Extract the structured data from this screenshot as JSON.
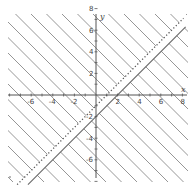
{
  "chart_data": {
    "type": "inequality-graph",
    "title": "",
    "xlabel": "x",
    "ylabel": "y",
    "xlim": [
      -8,
      8
    ],
    "ylim": [
      -8,
      8
    ],
    "x_ticks": [
      -6,
      -4,
      -2,
      2,
      4,
      6,
      8
    ],
    "y_ticks": [
      8,
      6,
      4,
      2,
      -2,
      -4,
      -6
    ],
    "grid": false,
    "boundary_lines": [
      {
        "name": "solid",
        "equation": "y = x - 2",
        "slope": 1,
        "intercept": -2,
        "style": "solid"
      },
      {
        "name": "dotted",
        "equation": "y = x - 1",
        "slope": 1,
        "intercept": -1,
        "style": "dotted"
      }
    ],
    "shaded_regions": [
      {
        "description": "above dotted line",
        "inequality": "y > x - 1"
      },
      {
        "description": "below solid line",
        "inequality": "y <= x - 2"
      }
    ],
    "unshaded_region": "strip between y = x - 2 and y = x - 1",
    "hatch_style": "diagonal lines, slope -1"
  },
  "colors": {
    "axis": "#555555",
    "hatch": "#8a8a8a",
    "boundary": "#666666",
    "background": "#ffffff"
  },
  "labels": {
    "x_axis": "x",
    "y_axis": "y",
    "x_tick_labels": [
      "-6",
      "-4",
      "-2",
      "2",
      "4",
      "6",
      "8"
    ],
    "y_tick_labels": [
      "8",
      "6",
      "4",
      "2",
      "-2",
      "-4",
      "-6"
    ]
  }
}
